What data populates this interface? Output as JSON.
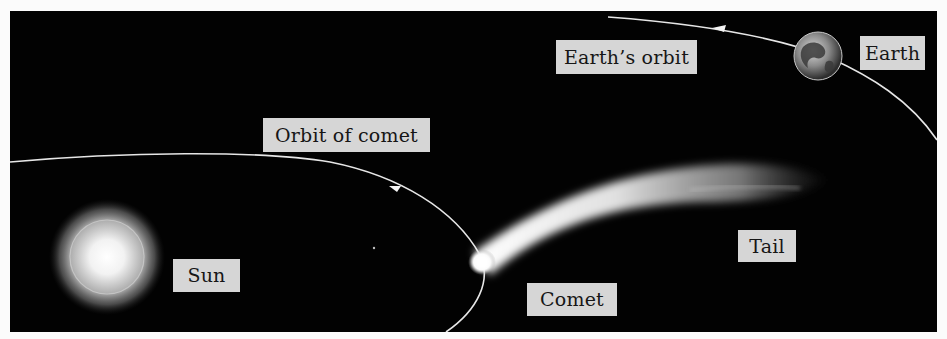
{
  "figure": {
    "background_color": "#020202",
    "label_box_color": "#d6d6d6",
    "label_text_color": "#161616",
    "orbit_line_color": "#e6e6e6"
  },
  "labels": {
    "earths_orbit": "Earth’s orbit",
    "earth": "Earth",
    "orbit_of_comet": "Orbit of comet",
    "sun": "Sun",
    "tail": "Tail",
    "comet": "Comet"
  },
  "objects": {
    "sun": {
      "name": "Sun",
      "shape": "glowing-sphere"
    },
    "earth": {
      "name": "Earth",
      "shape": "globe"
    },
    "comet": {
      "name": "Comet",
      "parts": [
        "head",
        "tail"
      ]
    },
    "orbits": [
      {
        "name": "Earth’s orbit",
        "direction_arrow": "left"
      },
      {
        "name": "Orbit of comet",
        "direction_arrow": "left"
      }
    ]
  }
}
